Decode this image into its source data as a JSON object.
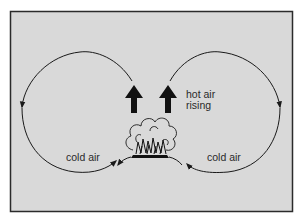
{
  "figure": {
    "colors": {
      "background": "#d9d9d9",
      "frame": "#2b2b2b",
      "ink": "#1a1a1a",
      "page": "#ffffff"
    }
  },
  "labels": {
    "hot_air_line1": "hot air",
    "hot_air_line2": "rising",
    "cold_air_left": "cold air",
    "cold_air_right": "cold air"
  },
  "elements": {
    "left_loop": "clockwise loop: rises from fire, arcs left, descends, returns as cold air",
    "right_loop": "counter-clockwise loop: rises from fire, arcs right, descends, returns as cold air",
    "up_arrows": 2,
    "fire": "burning fire with smoke cloud on a mound"
  }
}
